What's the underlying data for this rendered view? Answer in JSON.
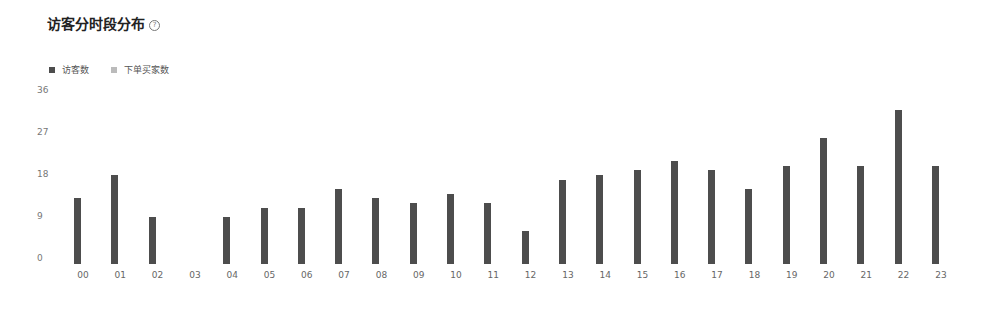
{
  "header": {
    "title": "访客分时段分布",
    "help_icon": "question-circle-icon"
  },
  "legend": [
    {
      "label": "访客数",
      "color": "#4d4d4d"
    },
    {
      "label": "下单买家数",
      "color": "#bbbbbb"
    }
  ],
  "chart_data": {
    "type": "bar",
    "title": "访客分时段分布",
    "xlabel": "",
    "ylabel": "",
    "ylim": [
      0,
      36
    ],
    "yticks": [
      0,
      9,
      18,
      27,
      36
    ],
    "grid": false,
    "legend_position": "top-left",
    "categories": [
      "00",
      "01",
      "02",
      "03",
      "04",
      "05",
      "06",
      "07",
      "08",
      "09",
      "10",
      "11",
      "12",
      "13",
      "14",
      "15",
      "16",
      "17",
      "18",
      "19",
      "20",
      "21",
      "22",
      "23"
    ],
    "series": [
      {
        "name": "访客数",
        "color": "#4d4d4d",
        "values": [
          13,
          18,
          9,
          0,
          9,
          11,
          11,
          15,
          13,
          12,
          14,
          12,
          6,
          17,
          18,
          19,
          21,
          19,
          15,
          20,
          26,
          20,
          32,
          20
        ]
      },
      {
        "name": "下单买家数",
        "color": "#bbbbbb",
        "values": [
          0,
          0,
          0,
          0,
          0,
          0,
          0,
          0,
          0,
          0,
          0,
          0,
          0,
          0,
          0,
          0,
          0,
          0,
          0,
          0,
          0,
          0,
          0,
          0
        ]
      }
    ]
  }
}
